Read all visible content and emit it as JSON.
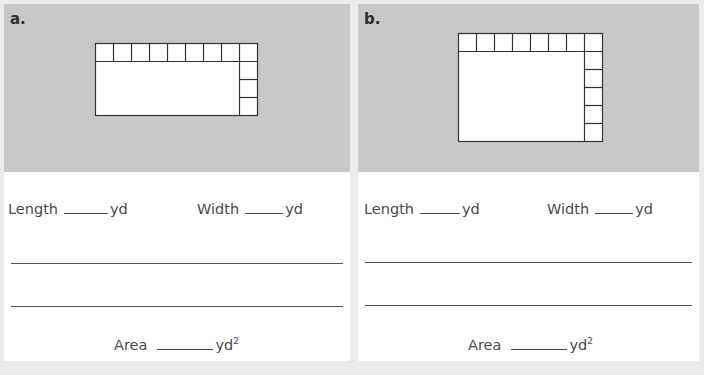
{
  "problems": [
    {
      "label": "a.",
      "grid": {
        "top_row_squares": 9,
        "right_column_squares": 4,
        "square_size_px": 18
      },
      "length_label": "Length",
      "length_unit": "yd",
      "width_label": "Width",
      "width_unit": "yd",
      "area_label": "Area",
      "area_unit": "yd",
      "area_exponent": "2"
    },
    {
      "label": "b.",
      "grid": {
        "top_row_squares": 8,
        "right_column_squares": 6,
        "square_size_px": 18
      },
      "length_label": "Length",
      "length_unit": "yd",
      "width_label": "Width",
      "width_unit": "yd",
      "area_label": "Area",
      "area_unit": "yd",
      "area_exponent": "2"
    }
  ],
  "colors": {
    "page_background": "#ebebeb",
    "figure_background": "#c8c8c8",
    "answer_background": "#ffffff",
    "grid_stroke": "#333333"
  }
}
